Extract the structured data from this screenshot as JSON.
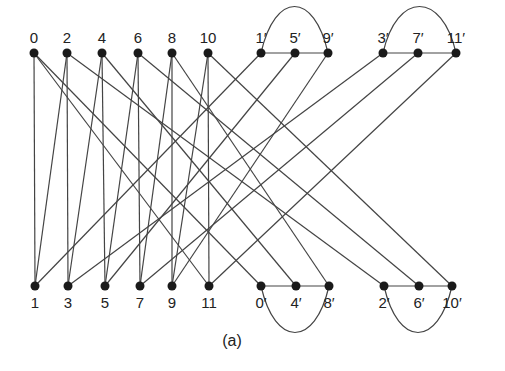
{
  "caption": "(a)",
  "colors": {
    "edge": "#444444",
    "node": "#1a1a1a",
    "label": "#222222",
    "background": "#ffffff"
  },
  "nodes": {
    "top": [
      {
        "id": "0",
        "label": "0",
        "x": 34,
        "y": 53
      },
      {
        "id": "2",
        "label": "2",
        "x": 67,
        "y": 53
      },
      {
        "id": "4",
        "label": "4",
        "x": 102,
        "y": 53
      },
      {
        "id": "6",
        "label": "6",
        "x": 138,
        "y": 53
      },
      {
        "id": "8",
        "label": "8",
        "x": 172,
        "y": 53
      },
      {
        "id": "10",
        "label": "10",
        "x": 208,
        "y": 53
      },
      {
        "id": "1p",
        "label": "1′",
        "x": 261,
        "y": 53
      },
      {
        "id": "5p",
        "label": "5′",
        "x": 295,
        "y": 53
      },
      {
        "id": "9p",
        "label": "9′",
        "x": 328,
        "y": 53
      },
      {
        "id": "3p",
        "label": "3′",
        "x": 383,
        "y": 53
      },
      {
        "id": "7p",
        "label": "7′",
        "x": 418,
        "y": 53
      },
      {
        "id": "11p",
        "label": "11′",
        "x": 456,
        "y": 53
      }
    ],
    "bottom": [
      {
        "id": "1",
        "label": "1",
        "x": 35,
        "y": 286
      },
      {
        "id": "3",
        "label": "3",
        "x": 68,
        "y": 286
      },
      {
        "id": "5",
        "label": "5",
        "x": 105,
        "y": 286
      },
      {
        "id": "7",
        "label": "7",
        "x": 140,
        "y": 286
      },
      {
        "id": "9",
        "label": "9",
        "x": 172,
        "y": 286
      },
      {
        "id": "11",
        "label": "11",
        "x": 209,
        "y": 286
      },
      {
        "id": "0p",
        "label": "0′",
        "x": 261,
        "y": 286
      },
      {
        "id": "4p",
        "label": "4′",
        "x": 296,
        "y": 286
      },
      {
        "id": "8p",
        "label": "8′",
        "x": 329,
        "y": 286
      },
      {
        "id": "2p",
        "label": "2′",
        "x": 384,
        "y": 286
      },
      {
        "id": "6p",
        "label": "6′",
        "x": 419,
        "y": 286
      },
      {
        "id": "10p",
        "label": "10′",
        "x": 452,
        "y": 286
      }
    ]
  },
  "edges": [
    [
      "0",
      "1"
    ],
    [
      "0",
      "11"
    ],
    [
      "2",
      "1"
    ],
    [
      "2",
      "3"
    ],
    [
      "4",
      "3"
    ],
    [
      "4",
      "5"
    ],
    [
      "6",
      "5"
    ],
    [
      "6",
      "7"
    ],
    [
      "8",
      "7"
    ],
    [
      "8",
      "9"
    ],
    [
      "10",
      "9"
    ],
    [
      "10",
      "11"
    ],
    [
      "0",
      "0p"
    ],
    [
      "2",
      "2p"
    ],
    [
      "4",
      "4p"
    ],
    [
      "6",
      "6p"
    ],
    [
      "8",
      "8p"
    ],
    [
      "10",
      "10p"
    ],
    [
      "1",
      "1p"
    ],
    [
      "3",
      "3p"
    ],
    [
      "5",
      "5p"
    ],
    [
      "7",
      "7p"
    ],
    [
      "9",
      "9p"
    ],
    [
      "11",
      "11p"
    ],
    [
      "1p",
      "5p"
    ],
    [
      "5p",
      "9p"
    ],
    [
      "3p",
      "7p"
    ],
    [
      "7p",
      "11p"
    ],
    [
      "0p",
      "4p"
    ],
    [
      "4p",
      "8p"
    ],
    [
      "2p",
      "6p"
    ],
    [
      "6p",
      "10p"
    ]
  ],
  "arcs": [
    {
      "from": "1p",
      "to": "9p",
      "side": "top"
    },
    {
      "from": "3p",
      "to": "11p",
      "side": "top"
    },
    {
      "from": "0p",
      "to": "8p",
      "side": "bottom"
    },
    {
      "from": "2p",
      "to": "10p",
      "side": "bottom"
    }
  ]
}
